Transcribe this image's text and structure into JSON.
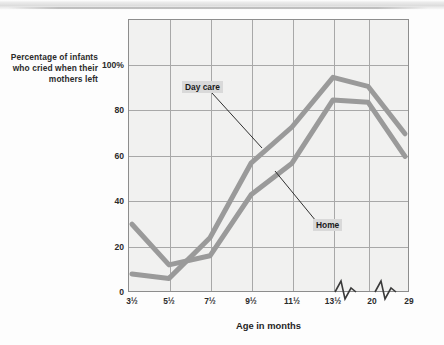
{
  "figure": {
    "y_caption": "Percentage of infants who cried when their mothers left",
    "x_axis_title": "Age in months",
    "series_label_daycare": "Day care",
    "series_label_home": "Home",
    "line_color": "#9a9a9a",
    "plot_bg": "#f1f1f0",
    "grid_color": "#a8a8a8",
    "axis_color": "#8d8d8d",
    "label_highlight": "#d9d9d9"
  },
  "chart_data": {
    "type": "line",
    "title": "",
    "xlabel": "Age in months",
    "ylabel": "Percentage of infants who cried when their mothers left",
    "categories": [
      "3½",
      "5½",
      "7½",
      "9½",
      "11½",
      "13½",
      "20",
      "29"
    ],
    "x_tick_labels": [
      "3½",
      "5½",
      "7½",
      "9½",
      "11½",
      "13½",
      "20",
      "29"
    ],
    "y_tick_labels": [
      "0",
      "20",
      "40",
      "60",
      "80",
      "100%"
    ],
    "y_ticks": [
      0,
      20,
      40,
      60,
      80,
      100
    ],
    "ylim": [
      0,
      120
    ],
    "grid": true,
    "legend": "inline-annotations",
    "axis_breaks": [
      "between 13½ and 20",
      "between 20 and 29"
    ],
    "series": [
      {
        "name": "Day care",
        "values": [
          8,
          6,
          24,
          57,
          73,
          95,
          91,
          70
        ]
      },
      {
        "name": "Home",
        "values": [
          30,
          12,
          16,
          43,
          57,
          85,
          84,
          60
        ]
      }
    ],
    "annotations": [
      {
        "text": "Day care",
        "points_to_series": "Day care"
      },
      {
        "text": "Home",
        "points_to_series": "Home"
      }
    ]
  }
}
